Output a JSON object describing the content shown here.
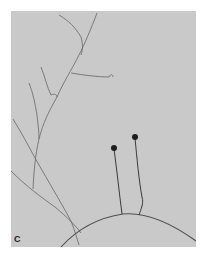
{
  "figure": {
    "panel_label": "C",
    "colors": {
      "background": "#c9c9c9",
      "hyphae": "#555555",
      "sporangia": "#222222"
    }
  }
}
